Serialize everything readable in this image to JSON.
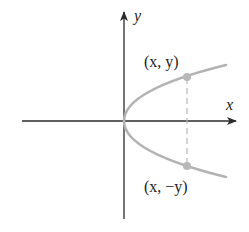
{
  "diagram": {
    "type": "parabola-symmetry",
    "axes": {
      "x_label": "x",
      "y_label": "y"
    },
    "points": [
      {
        "id": "upper",
        "label": "(x, y)"
      },
      {
        "id": "lower",
        "label": "(x, −y)"
      }
    ],
    "colors": {
      "axis": "#2b2b2b",
      "curve": "#b3b3b3",
      "point": "#b8b8b8",
      "dashed": "#b8b8b8",
      "text": "#222222"
    }
  }
}
